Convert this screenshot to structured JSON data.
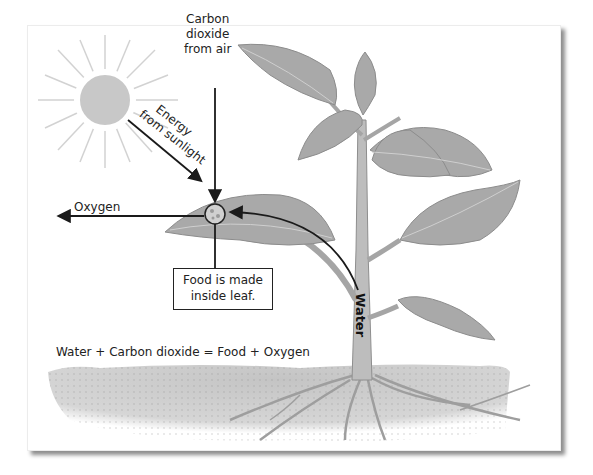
{
  "diagram": {
    "type": "photosynthesis-illustration",
    "labels": {
      "carbon_dioxide": [
        "Carbon",
        "dioxide",
        "from air"
      ],
      "energy": [
        "Energy",
        "from sunlight"
      ],
      "oxygen": "Oxygen",
      "food_box": [
        "Food is made",
        "inside leaf."
      ],
      "water": "Water",
      "equation": "Water + Carbon dioxide = Food + Oxygen"
    },
    "colors": {
      "sun": "#c8c8c8",
      "leaf": "#a9a9a9",
      "stem": "#bdbdbd",
      "soil": "#cfcfcf",
      "arrow": "#1a1a1a"
    }
  }
}
